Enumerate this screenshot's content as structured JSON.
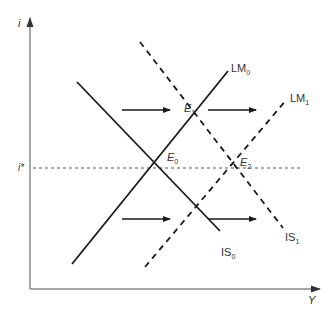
{
  "diagram": {
    "type": "IS-LM",
    "axes": {
      "y_label": "i",
      "x_label": "Y",
      "reference_rate_label": "i*"
    },
    "curves": {
      "is0": {
        "label": "IS",
        "sub": "0",
        "style": "solid"
      },
      "lm0": {
        "label": "LM",
        "sub": "0",
        "style": "solid"
      },
      "is1": {
        "label": "IS",
        "sub": "1",
        "style": "dashed"
      },
      "lm1": {
        "label": "LM",
        "sub": "1",
        "style": "dashed"
      }
    },
    "equilibria": {
      "e0": {
        "label": "E",
        "sub": "0"
      },
      "e1": {
        "label": "E",
        "sub": "1"
      },
      "e2": {
        "label": "E",
        "sub": "2"
      }
    },
    "shift_arrows": 4,
    "colors": {
      "line": "#1a1a1a",
      "axis": "#888888",
      "text": "#333333"
    }
  }
}
